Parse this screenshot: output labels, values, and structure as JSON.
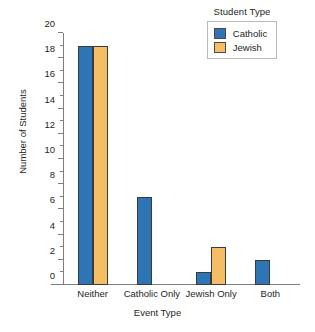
{
  "chart_data": {
    "type": "bar",
    "title": "",
    "xlabel": "Event Type",
    "ylabel": "Number of Students",
    "categories": [
      "Neither",
      "Catholic Only",
      "Jewish Only",
      "Both"
    ],
    "series": [
      {
        "name": "Catholic",
        "color": "#2e75b6",
        "values": [
          19,
          7,
          1,
          2
        ]
      },
      {
        "name": "Jewish",
        "color": "#f5be64",
        "values": [
          19,
          0,
          3,
          0
        ]
      }
    ],
    "ylim": [
      0,
      20
    ],
    "ytick_labels": [
      "0",
      "2",
      "4",
      "6",
      "8",
      "10",
      "12",
      "14",
      "16",
      "18",
      "20"
    ],
    "ytick_values": [
      0,
      2,
      4,
      6,
      8,
      10,
      12,
      14,
      16,
      18,
      20
    ],
    "yminor_tick_values": [
      1,
      3,
      5,
      7,
      9,
      11,
      13,
      15,
      17,
      19
    ],
    "grid": false,
    "legend": {
      "title": "Student Type",
      "position": "top-right",
      "entries": [
        {
          "label": "Catholic",
          "color": "#2e75b6"
        },
        {
          "label": "Jewish",
          "color": "#f5be64"
        }
      ]
    },
    "axis_color": "#7d7d7d",
    "bar_edge_color": "#3a3a3a"
  }
}
